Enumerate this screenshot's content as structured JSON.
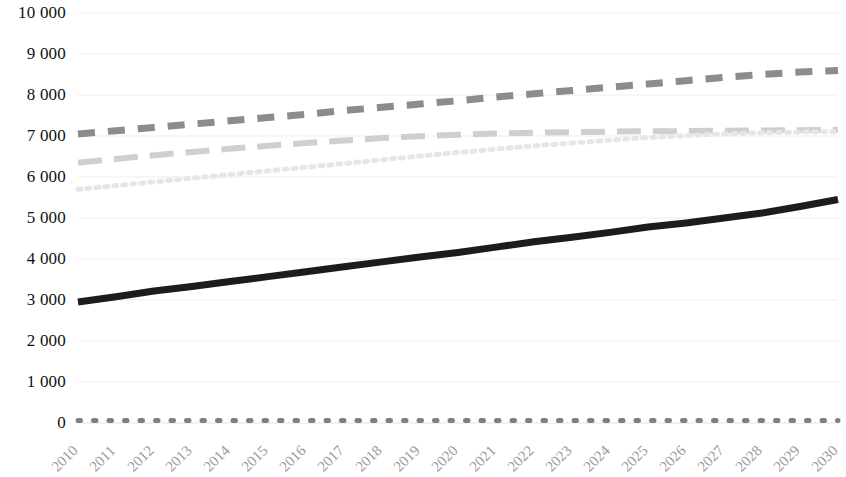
{
  "chart_data": {
    "type": "line",
    "title": "",
    "subtitle": "",
    "xlabel": "",
    "ylabel": "",
    "grid": true,
    "legend": "none",
    "ylim": [
      0,
      10000
    ],
    "ytick_step": 1000,
    "ytick_labels": [
      "10 000",
      "9 000",
      "8 000",
      "7 000",
      "6 000",
      "5 000",
      "4 000",
      "3 000",
      "2 000",
      "1 000",
      "0"
    ],
    "ytick_values": [
      10000,
      9000,
      8000,
      7000,
      6000,
      5000,
      4000,
      3000,
      2000,
      1000,
      0
    ],
    "categories": [
      "2010",
      "2011",
      "2012",
      "2013",
      "2014",
      "2015",
      "2016",
      "2017",
      "2018",
      "2019",
      "2020",
      "2021",
      "2022",
      "2023",
      "2024",
      "2025",
      "2026",
      "2027",
      "2028",
      "2029",
      "2030"
    ],
    "series": [
      {
        "name": "series-1-dashed-dark",
        "style": "dashed",
        "color": "#8c8c8c",
        "width": 7,
        "dasharray": "17 13",
        "values": [
          7050,
          7130,
          7210,
          7290,
          7370,
          7450,
          7530,
          7620,
          7700,
          7780,
          7860,
          7950,
          8030,
          8110,
          8190,
          8270,
          8350,
          8430,
          8500,
          8560,
          8600
        ]
      },
      {
        "name": "series-2-dashed-light",
        "style": "dashed",
        "color": "#cfcfcf",
        "width": 6,
        "dasharray": "24 12",
        "values": [
          6350,
          6440,
          6530,
          6610,
          6690,
          6760,
          6830,
          6890,
          6950,
          6995,
          7030,
          7060,
          7080,
          7095,
          7105,
          7115,
          7120,
          7128,
          7134,
          7140,
          7150
        ]
      },
      {
        "name": "series-3-dotted-faint",
        "style": "dotted",
        "color": "#e6e6e6",
        "width": 5,
        "dasharray": "3 6",
        "values": [
          5700,
          5790,
          5880,
          5970,
          6060,
          6150,
          6240,
          6330,
          6420,
          6510,
          6600,
          6680,
          6760,
          6830,
          6900,
          6960,
          7010,
          7050,
          7080,
          7095,
          7105
        ]
      },
      {
        "name": "series-4-solid-black",
        "style": "solid",
        "color": "#1c1c1c",
        "width": 7,
        "dasharray": "",
        "values": [
          2950,
          3080,
          3220,
          3330,
          3450,
          3570,
          3690,
          3810,
          3930,
          4050,
          4160,
          4290,
          4420,
          4530,
          4650,
          4780,
          4880,
          5000,
          5120,
          5280,
          5450
        ]
      },
      {
        "name": "series-5-dotted-baseline",
        "style": "dotted",
        "color": "#7f7f7f",
        "width": 5,
        "dasharray": "2.5 13",
        "values": [
          60,
          60,
          60,
          60,
          60,
          60,
          60,
          60,
          60,
          60,
          60,
          60,
          60,
          60,
          60,
          60,
          60,
          60,
          60,
          60,
          60
        ]
      }
    ]
  },
  "colors": {
    "gridline": "#ededed",
    "axis_text": "#111111",
    "xaxis_text": "#9a9a9a",
    "background": "#ffffff"
  }
}
